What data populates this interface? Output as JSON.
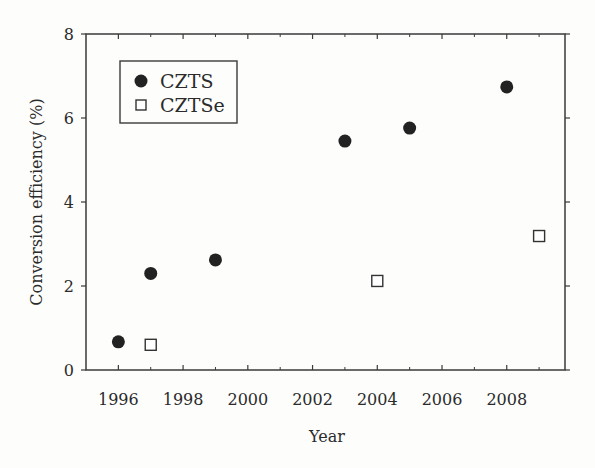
{
  "chart_data": {
    "type": "scatter",
    "title": "",
    "xlabel": "Year",
    "ylabel": "Conversion efficiency (%)",
    "xlim": [
      1995,
      2009.8
    ],
    "ylim": [
      0,
      8
    ],
    "x_ticks": [
      1996,
      1998,
      2000,
      2002,
      2004,
      2006,
      2008
    ],
    "x_tick_labels": [
      "1996",
      "1998",
      "2000",
      "2002",
      "2004",
      "2006",
      "2008"
    ],
    "x_minor_ticks": [
      1997,
      1999,
      2001,
      2003,
      2005,
      2007,
      2009
    ],
    "y_ticks": [
      0,
      2,
      4,
      6,
      8
    ],
    "y_tick_labels": [
      "0",
      "2",
      "4",
      "6",
      "8"
    ],
    "grid": false,
    "legend_position": "upper left",
    "series": [
      {
        "name": "CZTS",
        "marker": "filled-circle",
        "color": "#222222",
        "points": [
          {
            "x": 1996,
            "y": 0.67
          },
          {
            "x": 1997,
            "y": 2.3
          },
          {
            "x": 1999,
            "y": 2.62
          },
          {
            "x": 2003,
            "y": 5.45
          },
          {
            "x": 2005,
            "y": 5.76
          },
          {
            "x": 2008,
            "y": 6.74
          }
        ]
      },
      {
        "name": "CZTSe",
        "marker": "open-square",
        "color": "#333333",
        "points": [
          {
            "x": 1997,
            "y": 0.6
          },
          {
            "x": 2004,
            "y": 2.12
          },
          {
            "x": 2009,
            "y": 3.19
          }
        ]
      }
    ]
  },
  "colors": {
    "axis": "#3a3a3a",
    "background": "#fdfdfc"
  }
}
